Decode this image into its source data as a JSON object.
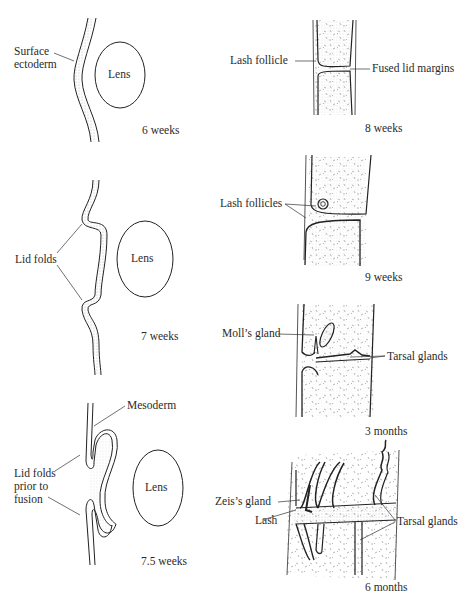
{
  "figure": {
    "panels_left": [
      {
        "caption": "6 weeks",
        "labels": [
          "Surface\nectoderm"
        ],
        "lens": "Lens"
      },
      {
        "caption": "7 weeks",
        "labels": [
          "Lid folds"
        ],
        "lens": "Lens"
      },
      {
        "caption": "7.5 weeks",
        "labels": [
          "Mesoderm",
          "Lid folds\nprior to\nfusion"
        ],
        "lens": "Lens"
      }
    ],
    "panels_right": [
      {
        "caption": "8 weeks",
        "labels": [
          "Lash follicle",
          "Fused lid margins"
        ]
      },
      {
        "caption": "9 weeks",
        "labels": [
          "Lash follicles"
        ]
      },
      {
        "caption": "3 months",
        "labels": [
          "Moll’s gland",
          "Tarsal glands"
        ]
      },
      {
        "caption": "6 months",
        "labels": [
          "Zeis’s gland",
          "Lash",
          "Tarsal glands"
        ]
      }
    ],
    "text": {
      "p1_label_line1": "Surface",
      "p1_label_line2": "ectoderm",
      "p2_label": "Lid folds",
      "p3_label_mesoderm": "Mesoderm",
      "p3_label_line1": "Lid folds",
      "p3_label_line2": "prior to",
      "p3_label_line3": "fusion",
      "lens": "Lens",
      "r1_lash_follicle": "Lash follicle",
      "r1_fused": "Fused lid margins",
      "r2_lash_follicles": "Lash follicles",
      "r3_molls": "Moll’s gland",
      "r3_tarsal": "Tarsal glands",
      "r4_zeis": "Zeis’s gland",
      "r4_lash": "Lash",
      "r4_tarsal": "Tarsal glands",
      "cap_6w": "6 weeks",
      "cap_7w": "7 weeks",
      "cap_75w": "7.5 weeks",
      "cap_8w": "8 weeks",
      "cap_9w": "9 weeks",
      "cap_3m": "3 months",
      "cap_6m": "6 months"
    }
  }
}
